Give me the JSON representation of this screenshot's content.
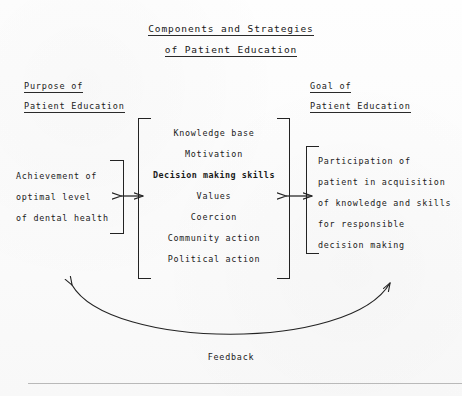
{
  "title": {
    "line1": "Components and Strategies",
    "line2": "of Patient Education"
  },
  "left_column": {
    "heading_line1": "Purpose of",
    "heading_line2": "Patient Education",
    "box_lines": [
      "Achievement of",
      "optimal level",
      "of dental health"
    ]
  },
  "center_column": {
    "box_lines": [
      "Knowledge base",
      "Motivation",
      "Decision making skills",
      "Values",
      "Coercion",
      "Community action",
      "Political action"
    ]
  },
  "right_column": {
    "heading_line1": "Goal of",
    "heading_line2": "Patient Education",
    "box_lines": [
      "Participation of",
      "patient in acquisition",
      "of knowledge and skills",
      "for responsible",
      "decision making"
    ]
  },
  "feedback": {
    "label": "Feedback"
  },
  "colors": {
    "ink": "#1a1a1a",
    "rule": "#b9b9b9",
    "paper": "#fdfdfd"
  }
}
